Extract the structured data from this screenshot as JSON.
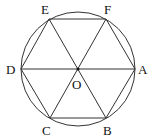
{
  "diagram": {
    "title": "",
    "circle": {
      "cx": 78,
      "cy": 69,
      "r": 57
    },
    "points": [
      {
        "id": "A",
        "label": "A",
        "x": 135,
        "y": 69,
        "lx": 138,
        "ly": 74
      },
      {
        "id": "B",
        "label": "B",
        "x": 106,
        "y": 118,
        "lx": 103,
        "ly": 135
      },
      {
        "id": "C",
        "label": "C",
        "x": 50,
        "y": 118,
        "lx": 42,
        "ly": 135
      },
      {
        "id": "D",
        "label": "D",
        "x": 21,
        "y": 69,
        "lx": 6,
        "ly": 74
      },
      {
        "id": "E",
        "label": "E",
        "x": 49,
        "y": 19,
        "lx": 41,
        "ly": 14
      },
      {
        "id": "F",
        "label": "F",
        "x": 106,
        "y": 19,
        "lx": 104,
        "ly": 14
      },
      {
        "id": "O",
        "label": "O",
        "x": 78,
        "y": 69,
        "lx": 72,
        "ly": 89
      }
    ],
    "edges": [
      [
        "A",
        "B"
      ],
      [
        "B",
        "C"
      ],
      [
        "C",
        "D"
      ],
      [
        "D",
        "E"
      ],
      [
        "E",
        "F"
      ],
      [
        "F",
        "A"
      ],
      [
        "A",
        "D"
      ],
      [
        "B",
        "E"
      ],
      [
        "C",
        "F"
      ]
    ]
  }
}
